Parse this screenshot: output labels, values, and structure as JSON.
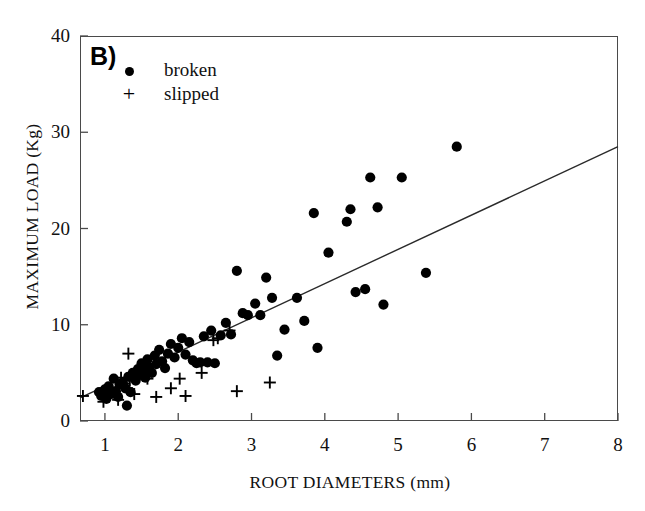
{
  "figure": {
    "panel_tag": "B)",
    "xlabel": "ROOT DIAMETERS (mm)",
    "ylabel": "MAXIMUM LOAD (Kg)"
  },
  "legend": {
    "position": "top-left-inside",
    "entries": [
      {
        "marker": "filled-circle",
        "label": "broken"
      },
      {
        "marker": "plus",
        "label": "slipped"
      }
    ]
  },
  "axes": {
    "x_ticks": [
      "1",
      "2",
      "3",
      "4",
      "5",
      "6",
      "7",
      "8"
    ],
    "y_ticks": [
      "0",
      "10",
      "20",
      "30",
      "40"
    ]
  },
  "colors": {
    "marker": "#000000",
    "line": "#2a2a2a",
    "frame": "#4a4a4a",
    "background": "#ffffff"
  },
  "chart_data": {
    "type": "scatter",
    "title": "B)",
    "xlabel": "ROOT DIAMETERS (mm)",
    "ylabel": "MAXIMUM LOAD (Kg)",
    "xlim": [
      0.66,
      8.0
    ],
    "ylim": [
      0,
      40
    ],
    "xticks": [
      1,
      2,
      3,
      4,
      5,
      6,
      7,
      8
    ],
    "yticks": [
      0,
      10,
      20,
      30,
      40
    ],
    "grid": false,
    "legend_position": "upper left",
    "series": [
      {
        "name": "broken",
        "marker": "filled-circle",
        "points": [
          [
            0.92,
            3.0
          ],
          [
            0.95,
            2.6
          ],
          [
            1.0,
            3.3
          ],
          [
            1.02,
            2.3
          ],
          [
            1.05,
            3.6
          ],
          [
            1.08,
            2.8
          ],
          [
            1.12,
            4.4
          ],
          [
            1.15,
            3.1
          ],
          [
            1.18,
            2.5
          ],
          [
            1.2,
            3.8
          ],
          [
            1.24,
            4.0
          ],
          [
            1.28,
            3.4
          ],
          [
            1.3,
            1.6
          ],
          [
            1.32,
            4.6
          ],
          [
            1.35,
            3.0
          ],
          [
            1.38,
            5.0
          ],
          [
            1.42,
            4.2
          ],
          [
            1.45,
            5.4
          ],
          [
            1.48,
            4.8
          ],
          [
            1.5,
            6.0
          ],
          [
            1.52,
            5.2
          ],
          [
            1.55,
            4.5
          ],
          [
            1.58,
            6.4
          ],
          [
            1.6,
            5.6
          ],
          [
            1.64,
            5.0
          ],
          [
            1.68,
            6.8
          ],
          [
            1.7,
            5.9
          ],
          [
            1.74,
            7.4
          ],
          [
            1.78,
            6.2
          ],
          [
            1.82,
            5.5
          ],
          [
            1.86,
            7.0
          ],
          [
            1.9,
            8.0
          ],
          [
            1.95,
            6.6
          ],
          [
            2.0,
            7.6
          ],
          [
            2.05,
            8.6
          ],
          [
            2.1,
            6.9
          ],
          [
            2.15,
            8.2
          ],
          [
            2.2,
            6.3
          ],
          [
            2.25,
            6.0
          ],
          [
            2.3,
            6.1
          ],
          [
            2.35,
            8.8
          ],
          [
            2.4,
            6.1
          ],
          [
            2.45,
            9.4
          ],
          [
            2.5,
            6.0
          ],
          [
            2.58,
            8.9
          ],
          [
            2.65,
            10.2
          ],
          [
            2.72,
            9.0
          ],
          [
            2.8,
            15.6
          ],
          [
            2.88,
            11.2
          ],
          [
            2.95,
            11.0
          ],
          [
            3.05,
            12.2
          ],
          [
            3.12,
            11.0
          ],
          [
            3.2,
            14.9
          ],
          [
            3.28,
            12.8
          ],
          [
            3.35,
            6.8
          ],
          [
            3.45,
            9.5
          ],
          [
            3.62,
            12.8
          ],
          [
            3.72,
            10.4
          ],
          [
            3.85,
            21.6
          ],
          [
            3.9,
            7.6
          ],
          [
            4.05,
            17.5
          ],
          [
            4.3,
            20.7
          ],
          [
            4.35,
            22.0
          ],
          [
            4.42,
            13.4
          ],
          [
            4.55,
            13.7
          ],
          [
            4.62,
            25.3
          ],
          [
            4.72,
            22.2
          ],
          [
            4.8,
            12.1
          ],
          [
            5.05,
            25.3
          ],
          [
            5.38,
            15.4
          ],
          [
            5.8,
            28.5
          ]
        ]
      },
      {
        "name": "slipped",
        "marker": "plus",
        "points": [
          [
            0.7,
            2.6
          ],
          [
            0.98,
            2.0
          ],
          [
            1.05,
            2.5
          ],
          [
            1.1,
            3.2
          ],
          [
            1.18,
            2.2
          ],
          [
            1.22,
            4.5
          ],
          [
            1.26,
            3.9
          ],
          [
            1.3,
            3.4
          ],
          [
            1.32,
            7.0
          ],
          [
            1.34,
            4.2
          ],
          [
            1.4,
            2.8
          ],
          [
            1.45,
            4.8
          ],
          [
            1.5,
            5.6
          ],
          [
            1.58,
            4.4
          ],
          [
            1.7,
            2.5
          ],
          [
            1.9,
            3.4
          ],
          [
            2.02,
            4.4
          ],
          [
            2.1,
            2.6
          ],
          [
            2.32,
            5.0
          ],
          [
            2.48,
            8.4
          ],
          [
            2.54,
            8.6
          ],
          [
            2.7,
            9.4
          ],
          [
            2.8,
            3.1
          ],
          [
            3.25,
            4.0
          ]
        ]
      }
    ],
    "regression_line": {
      "name": "fitted line",
      "x": [
        0.66,
        8.0
      ],
      "y": [
        2.4,
        28.5
      ]
    }
  }
}
